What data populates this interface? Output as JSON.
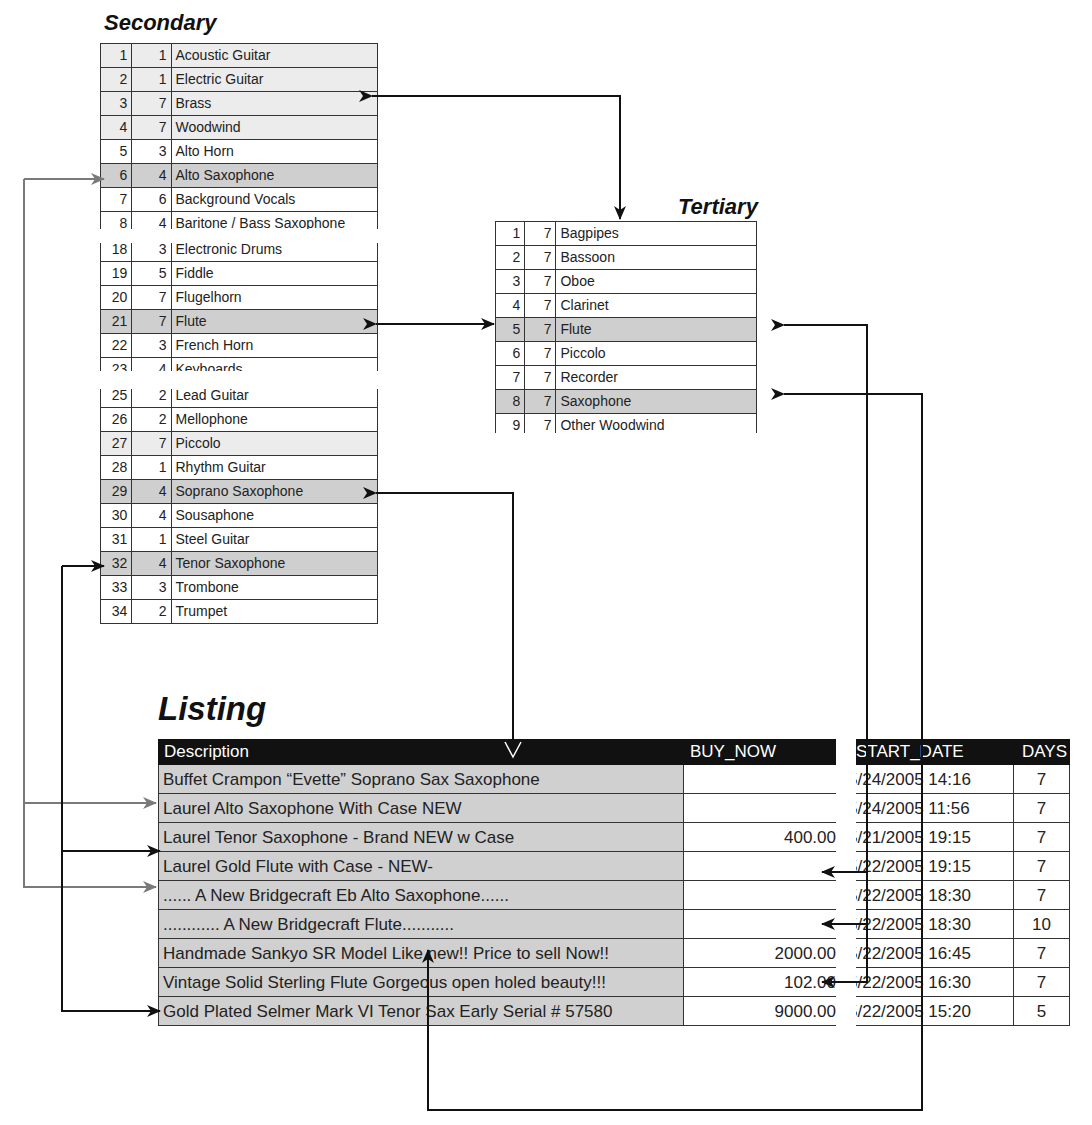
{
  "secondary": {
    "title": "Secondary",
    "block1": [
      {
        "id": "1",
        "cat": "1",
        "name": "Acoustic Guitar",
        "shade": "light"
      },
      {
        "id": "2",
        "cat": "1",
        "name": "Electric Guitar",
        "shade": "light"
      },
      {
        "id": "3",
        "cat": "7",
        "name": "Brass",
        "shade": "light"
      },
      {
        "id": "4",
        "cat": "7",
        "name": "Woodwind",
        "shade": "light"
      },
      {
        "id": "5",
        "cat": "3",
        "name": "Alto Horn",
        "shade": "white"
      },
      {
        "id": "6",
        "cat": "4",
        "name": "Alto Saxophone",
        "shade": "dark"
      },
      {
        "id": "7",
        "cat": "6",
        "name": "Background Vocals",
        "shade": "white"
      },
      {
        "id": "8",
        "cat": "4",
        "name": "Baritone / Bass Saxophone",
        "shade": "white"
      }
    ],
    "block2": [
      {
        "id": "18",
        "cat": "3",
        "name": "Electronic Drums",
        "shade": "white"
      },
      {
        "id": "19",
        "cat": "5",
        "name": "Fiddle",
        "shade": "white"
      },
      {
        "id": "20",
        "cat": "7",
        "name": "Flugelhorn",
        "shade": "white"
      },
      {
        "id": "21",
        "cat": "7",
        "name": "Flute",
        "shade": "dark"
      },
      {
        "id": "22",
        "cat": "3",
        "name": "French Horn",
        "shade": "white"
      },
      {
        "id": "23",
        "cat": "4",
        "name": "Keyboards",
        "shade": "white"
      }
    ],
    "block3": [
      {
        "id": "25",
        "cat": "2",
        "name": "Lead Guitar",
        "shade": "white"
      },
      {
        "id": "26",
        "cat": "2",
        "name": "Mellophone",
        "shade": "white"
      },
      {
        "id": "27",
        "cat": "7",
        "name": "Piccolo",
        "shade": "light"
      },
      {
        "id": "28",
        "cat": "1",
        "name": "Rhythm Guitar",
        "shade": "white"
      },
      {
        "id": "29",
        "cat": "4",
        "name": "Soprano Saxophone",
        "shade": "dark"
      },
      {
        "id": "30",
        "cat": "4",
        "name": "Sousaphone",
        "shade": "white"
      },
      {
        "id": "31",
        "cat": "1",
        "name": "Steel Guitar",
        "shade": "white"
      },
      {
        "id": "32",
        "cat": "4",
        "name": "Tenor Saxophone",
        "shade": "dark"
      },
      {
        "id": "33",
        "cat": "3",
        "name": "Trombone",
        "shade": "white"
      },
      {
        "id": "34",
        "cat": "2",
        "name": "Trumpet",
        "shade": "white"
      }
    ]
  },
  "tertiary": {
    "title": "Tertiary",
    "rows": [
      {
        "id": "1",
        "cat": "7",
        "name": "Bagpipes",
        "shade": "white"
      },
      {
        "id": "2",
        "cat": "7",
        "name": "Bassoon",
        "shade": "white"
      },
      {
        "id": "3",
        "cat": "7",
        "name": "Oboe",
        "shade": "white"
      },
      {
        "id": "4",
        "cat": "7",
        "name": "Clarinet",
        "shade": "white"
      },
      {
        "id": "5",
        "cat": "7",
        "name": "Flute",
        "shade": "dark"
      },
      {
        "id": "6",
        "cat": "7",
        "name": "Piccolo",
        "shade": "white"
      },
      {
        "id": "7",
        "cat": "7",
        "name": "Recorder",
        "shade": "white"
      },
      {
        "id": "8",
        "cat": "7",
        "name": "Saxophone",
        "shade": "dark"
      },
      {
        "id": "9",
        "cat": "7",
        "name": "Other Woodwind",
        "shade": "white"
      }
    ]
  },
  "listing": {
    "title": "Listing",
    "columns": {
      "description": "Description",
      "buy_now": "BUY_NOW",
      "start_date": "START_DATE",
      "days": "DAYS"
    },
    "rows": [
      {
        "description": "Buffet Crampon “Evette” Soprano Sax Saxophone",
        "buy_now": "",
        "start_date": "5/24/2005 14:16",
        "days": "7"
      },
      {
        "description": "Laurel Alto Saxophone With Case NEW",
        "buy_now": "",
        "start_date": "5/24/2005 11:56",
        "days": "7"
      },
      {
        "description": "Laurel Tenor Saxophone - Brand NEW w Case",
        "buy_now": "400.00",
        "start_date": "5/21/2005 19:15",
        "days": "7"
      },
      {
        "description": "Laurel Gold Flute with Case - NEW-",
        "buy_now": "",
        "start_date": "5/22/2005 19:15",
        "days": "7"
      },
      {
        "description": "...... A New Bridgecraft Eb Alto Saxophone......",
        "buy_now": "",
        "start_date": "5/22/2005 18:30",
        "days": "7"
      },
      {
        "description": "............ A New Bridgecraft Flute...........",
        "buy_now": "",
        "start_date": "5/22/2005 18:30",
        "days": "10"
      },
      {
        "description": "Handmade Sankyo SR Model Like new!! Price to sell Now!!",
        "buy_now": "2000.00",
        "start_date": "5/22/2005 16:45",
        "days": "7"
      },
      {
        "description": "Vintage Solid Sterling Flute Gorgeous open holed beauty!!!",
        "buy_now": "102.00",
        "start_date": "5/22/2005 16:30",
        "days": "7"
      },
      {
        "description": "Gold Plated Selmer Mark VI Tenor Sax Early Serial # 57580",
        "buy_now": "9000.00",
        "start_date": "5/22/2005 15:20",
        "days": "5"
      }
    ]
  },
  "colors": {
    "arrow_dark": "#111111",
    "arrow_gray": "#7a7a7a",
    "row_dark": "#cfcfcf",
    "row_light": "#ececec",
    "header_bg": "#111111"
  }
}
